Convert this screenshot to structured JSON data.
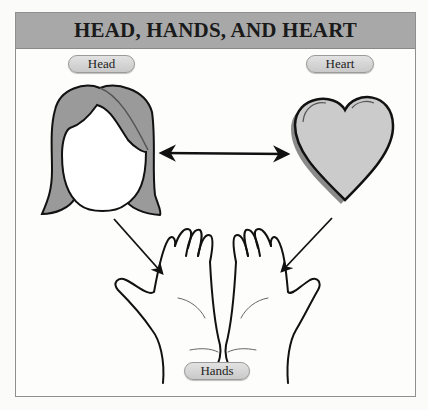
{
  "diagram": {
    "title": "HEAD, HANDS, AND HEART",
    "nodes": [
      {
        "id": "head",
        "label": "Head",
        "icon": "head-icon"
      },
      {
        "id": "heart",
        "label": "Heart",
        "icon": "heart-icon"
      },
      {
        "id": "hands",
        "label": "Hands",
        "icon": "hands-icon"
      }
    ],
    "edges": [
      {
        "from": "head",
        "to": "heart",
        "type": "bidirectional"
      },
      {
        "from": "head",
        "to": "hands",
        "type": "directed"
      },
      {
        "from": "heart",
        "to": "hands",
        "type": "directed"
      }
    ],
    "colors": {
      "header_bg": "#a8a8a8",
      "hair": "#9a9a9a",
      "heart_fill": "#c9c9c9",
      "pill_bg": "#d6d6d6",
      "stroke": "#111111"
    }
  }
}
